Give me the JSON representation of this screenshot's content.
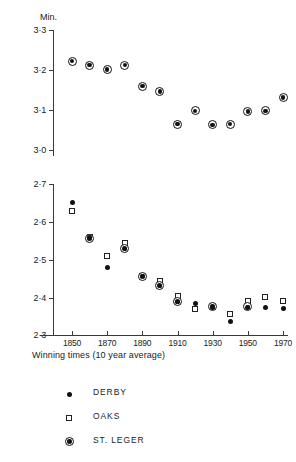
{
  "chart_data": [
    {
      "type": "scatter",
      "panel": "top",
      "title": "",
      "xlabel": "",
      "ylabel": "Min.",
      "ylim": [
        3.0,
        3.3
      ],
      "xlim": [
        1845,
        1975
      ],
      "yticks": [
        "3·3",
        "3·2",
        "3·1",
        "3·0"
      ],
      "ytick_values": [
        3.3,
        3.2,
        3.1,
        3.0
      ],
      "grid": false,
      "legend_position": "below-figure",
      "series": [
        {
          "name": "ST. LEGER",
          "marker": "bullseye",
          "x": [
            1850,
            1860,
            1870,
            1880,
            1890,
            1900,
            1910,
            1920,
            1930,
            1940,
            1950,
            1960,
            1970
          ],
          "values": [
            3.222,
            3.212,
            3.201,
            3.212,
            3.16,
            3.146,
            3.065,
            3.098,
            3.063,
            3.065,
            3.096,
            3.098,
            3.131
          ]
        }
      ]
    },
    {
      "type": "scatter",
      "panel": "bottom",
      "title": "",
      "xlabel": "Winning times (10 year average)",
      "ylabel": "",
      "ylim": [
        2.3,
        2.7
      ],
      "xlim": [
        1845,
        1975
      ],
      "yticks": [
        "2·7",
        "2·6",
        "2·5",
        "2·4",
        "2·3"
      ],
      "ytick_values": [
        2.7,
        2.6,
        2.5,
        2.4,
        2.3
      ],
      "xticks": [
        "1850",
        "1870",
        "1890",
        "1910",
        "1930",
        "1950",
        "1970"
      ],
      "xtick_values": [
        1850,
        1870,
        1890,
        1910,
        1930,
        1950,
        1970
      ],
      "grid": false,
      "series": [
        {
          "name": "DERBY",
          "marker": "disc",
          "x": [
            1850,
            1860,
            1870,
            1880,
            1890,
            1900,
            1910,
            1920,
            1930,
            1940,
            1950,
            1960,
            1970
          ],
          "values": [
            2.65,
            2.558,
            2.478,
            2.53,
            2.456,
            2.432,
            2.389,
            2.383,
            2.374,
            2.337,
            2.373,
            2.372,
            2.371
          ]
        },
        {
          "name": "OAKS",
          "marker": "open-square",
          "x": [
            1850,
            1860,
            1870,
            1880,
            1890,
            1900,
            1910,
            1920,
            1930,
            1940,
            1950,
            1960,
            1970
          ],
          "values": [
            2.629,
            2.559,
            2.508,
            2.545,
            2.457,
            2.444,
            2.404,
            2.368,
            2.375,
            2.355,
            2.39,
            2.4,
            2.391
          ]
        },
        {
          "name": "ST. LEGER",
          "marker": "bullseye",
          "x": [
            1850,
            1860,
            1870,
            1880,
            1890,
            1900,
            1910,
            1920,
            1930,
            1940,
            1950,
            1960,
            1970
          ],
          "values": [
            null,
            2.556,
            null,
            2.528,
            2.456,
            2.43,
            2.388,
            null,
            2.376,
            null,
            2.375,
            null,
            null
          ]
        }
      ]
    }
  ],
  "top_panel": {
    "unit_label": "Min.",
    "ytick_labels": [
      "3·3",
      "3·2",
      "3·1",
      "3·0"
    ]
  },
  "bottom_panel": {
    "ytick_labels": [
      "2·7",
      "2·6",
      "2·5",
      "2·4",
      "2·3"
    ],
    "xtick_labels": [
      "1850",
      "1870",
      "1890",
      "1910",
      "1930",
      "1950",
      "1970"
    ],
    "caption": "Winning times (10 year average)"
  },
  "legend": {
    "items": [
      {
        "label": "DERBY",
        "marker": "disc",
        "color": "#111111"
      },
      {
        "label": "OAKS",
        "marker": "open-square",
        "color": "#222222"
      },
      {
        "label": "ST. LEGER",
        "marker": "bullseye",
        "color": "#111111"
      }
    ]
  },
  "colors": {
    "axis": "#3a3a3a",
    "marker": "#111111",
    "background": "#ffffff",
    "text": "#222222"
  }
}
